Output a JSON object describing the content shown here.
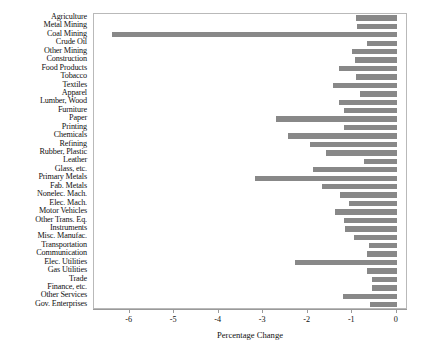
{
  "chart_data": {
    "type": "bar",
    "orientation": "horizontal",
    "title": "",
    "subtitle": "",
    "xlabel": "Percentage Change",
    "ylabel": "",
    "xlim": [
      -6.8,
      0.25
    ],
    "xticks": [
      -6,
      -5,
      -4,
      -3,
      -2,
      -1,
      0
    ],
    "xticklabels": [
      "-6",
      "-5",
      "-4",
      "-3",
      "-2",
      "-1",
      "0"
    ],
    "grid": false,
    "legend": null,
    "bar_color": "#888888",
    "panel_border_color": "#b9b9b9",
    "categories": [
      "Agriculture",
      "Metal Mining",
      "Coal Mining",
      "Crude Oil",
      "Other Mining",
      "Construction",
      "Food Products",
      "Tobacco",
      "Textiles",
      "Apparel",
      "Lumber, Wood",
      "Furniture",
      "Paper",
      "Printing",
      "Chemicals",
      "Refining",
      "Rubber, Plastic",
      "Leather",
      "Glass, etc.",
      "Primary Metals",
      "Fab. Metals",
      "Nonelec. Mach.",
      "Elec. Mach.",
      "Motor Vehicles",
      "Other Trans. Eq.",
      "Instruments",
      "Misc. Manufac.",
      "Transportation",
      "Communication",
      "Elec. Utilities",
      "Gas Utilities",
      "Trade",
      "Finance, etc.",
      "Other Services",
      "Gov. Enterprises"
    ],
    "values": [
      -0.91,
      -0.89,
      -6.4,
      -0.67,
      -1.0,
      -0.93,
      -1.29,
      -0.91,
      -1.44,
      -0.82,
      -1.29,
      -1.18,
      -2.71,
      -1.18,
      -2.44,
      -1.96,
      -1.6,
      -0.73,
      -1.89,
      -3.18,
      -1.67,
      -1.27,
      -1.07,
      -1.4,
      -1.18,
      -1.16,
      -0.96,
      -0.62,
      -0.67,
      -2.29,
      -0.67,
      -0.56,
      -0.56,
      -1.22,
      -0.6
    ]
  }
}
